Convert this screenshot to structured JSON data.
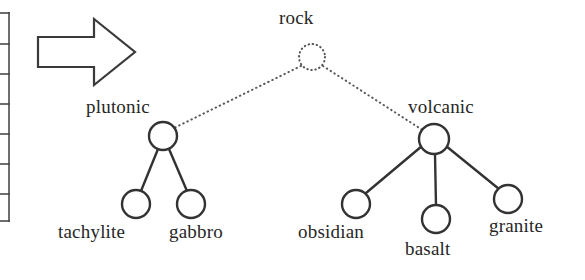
{
  "figure": {
    "type": "taxonomy-tree-diagram",
    "background_color": "#ffffff",
    "stroke_color": "#333333",
    "dotted_stroke_color": "#555555"
  },
  "left_fragment": {
    "name": "cropped-table-edge",
    "description": "Partial vertical rule with horizontal tick marks at the far left border",
    "tick_count": 7
  },
  "arrow": {
    "name": "right-arrow",
    "direction": "right",
    "filled": false
  },
  "tree": {
    "root": {
      "id": "rock",
      "label": "rock",
      "node_style": "dotted",
      "cx": 312,
      "cy": 57,
      "r": 13
    },
    "branches": [
      {
        "id": "plutonic",
        "label": "plutonic",
        "node_style": "solid",
        "edge_style": "dotted",
        "cx": 163,
        "cy": 136,
        "r": 14,
        "children": [
          {
            "id": "tachylite",
            "label": "tachylite",
            "node_style": "solid",
            "edge_style": "solid",
            "cx": 136,
            "cy": 204,
            "r": 14
          },
          {
            "id": "gabbro",
            "label": "gabbro",
            "node_style": "solid",
            "edge_style": "solid",
            "cx": 191,
            "cy": 204,
            "r": 14
          }
        ]
      },
      {
        "id": "volcanic",
        "label": "volcanic",
        "node_style": "solid",
        "edge_style": "dotted",
        "cx": 434,
        "cy": 139,
        "r": 15,
        "children": [
          {
            "id": "obsidian",
            "label": "obsidian",
            "node_style": "solid",
            "edge_style": "solid",
            "cx": 356,
            "cy": 204,
            "r": 14
          },
          {
            "id": "basalt",
            "label": "basalt",
            "node_style": "solid",
            "edge_style": "solid",
            "cx": 436,
            "cy": 219,
            "r": 14
          },
          {
            "id": "granite",
            "label": "granite",
            "node_style": "solid",
            "edge_style": "solid",
            "cx": 508,
            "cy": 199,
            "r": 14
          }
        ]
      }
    ]
  },
  "labels": {
    "rock": "rock",
    "plutonic": "plutonic",
    "volcanic": "volcanic",
    "tachylite": "tachylite",
    "gabbro": "gabbro",
    "obsidian": "obsidian",
    "basalt": "basalt",
    "granite": "granite"
  }
}
